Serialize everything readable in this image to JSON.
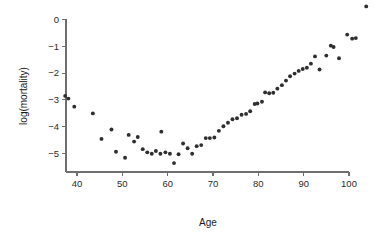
{
  "chart_data": {
    "type": "scatter",
    "title": "",
    "xlabel": "Age",
    "ylabel": "log(mortality)",
    "xlim": [
      36,
      105
    ],
    "ylim": [
      -5.6,
      0.6
    ],
    "xticks": [
      40,
      50,
      60,
      70,
      80,
      90,
      100
    ],
    "xtick_labels": [
      "40",
      "50",
      "60",
      "70",
      "80",
      "90",
      "100"
    ],
    "yticks": [
      0,
      -1,
      -2,
      -3,
      -4,
      -5
    ],
    "ytick_labels": [
      "0",
      "−1",
      "−2",
      "−3",
      "−4",
      "−5"
    ],
    "grid": false,
    "legend": null,
    "marker": "filled-circle",
    "marker_color": "#2e2e2e",
    "marker_size_px": 3,
    "series": [
      {
        "name": "log(mortality) by age",
        "x": [
          37.4,
          38.1,
          39.4,
          43.5,
          45.4,
          47.6,
          48.6,
          50.6,
          51.4,
          52.6,
          53.4,
          54.5,
          55.5,
          56.5,
          57.4,
          58.4,
          58.6,
          59.5,
          60.5,
          61.4,
          62.4,
          63.4,
          64.4,
          65.4,
          66.4,
          67.4,
          68.4,
          69.3,
          70.3,
          71.3,
          72.3,
          73.3,
          74.3,
          75.3,
          76.3,
          77.3,
          78.2,
          79.2,
          79.8,
          80.8,
          81.5,
          82.4,
          83.3,
          84.2,
          85.2,
          86.1,
          87.0,
          88.0,
          88.9,
          89.8,
          90.7,
          91.6,
          92.5,
          93.5,
          95.0,
          96.0,
          96.6,
          97.8,
          99.6,
          100.7,
          101.5,
          103.8
        ],
        "y": [
          -2.85,
          -2.95,
          -3.25,
          -3.5,
          -4.45,
          -4.1,
          -4.93,
          -5.15,
          -4.3,
          -4.55,
          -4.38,
          -4.83,
          -4.95,
          -5.0,
          -4.9,
          -5.0,
          -4.18,
          -4.95,
          -5.0,
          -5.35,
          -5.02,
          -4.62,
          -4.8,
          -5.0,
          -4.72,
          -4.68,
          -4.42,
          -4.42,
          -4.4,
          -4.15,
          -3.98,
          -3.85,
          -3.72,
          -3.68,
          -3.55,
          -3.52,
          -3.42,
          -3.15,
          -3.13,
          -3.07,
          -2.72,
          -2.75,
          -2.73,
          -2.58,
          -2.45,
          -2.28,
          -2.12,
          -2.02,
          -1.92,
          -1.85,
          -1.8,
          -1.65,
          -1.38,
          -1.87,
          -1.35,
          -0.98,
          -1.03,
          -1.45,
          -0.57,
          -0.72,
          -0.7,
          0.48
        ]
      }
    ]
  },
  "axes": {
    "x_title": "Age",
    "y_title": "log(mortality)"
  }
}
